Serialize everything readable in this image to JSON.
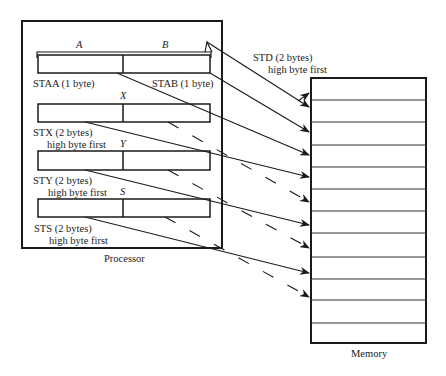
{
  "diagram": {
    "processor": {
      "label": "Processor",
      "registers": [
        {
          "id": "AB",
          "names": [
            "A",
            "B"
          ],
          "labels": [
            "STAA (1 byte)",
            "STAB (1 byte)"
          ]
        },
        {
          "id": "X",
          "name": "X",
          "label": "STX (2 bytes)",
          "sublabel": "high byte first"
        },
        {
          "id": "Y",
          "name": "Y",
          "label": "STY (2 bytes)",
          "sublabel": "high byte first"
        },
        {
          "id": "S",
          "name": "S",
          "label": "STS (2 bytes)",
          "sublabel": "high byte first"
        }
      ]
    },
    "std": {
      "label": "STD (2 bytes)",
      "sublabel": "high byte first"
    },
    "memory": {
      "label": "Memory",
      "row_count": 12
    },
    "colors": {
      "line": "#1a1a1a",
      "background": "#ffffff"
    }
  }
}
